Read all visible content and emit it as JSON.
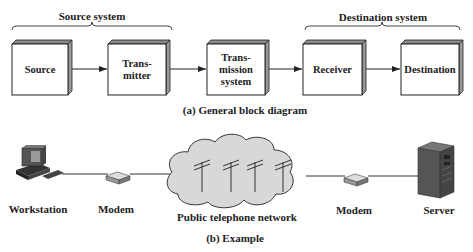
{
  "diagram_a": {
    "caption": "(a) General block diagram",
    "groups": {
      "source_system": "Source system",
      "destination_system": "Destination system"
    },
    "blocks": [
      {
        "id": "source",
        "label": "Source"
      },
      {
        "id": "transmitter",
        "label": "Trans-\nmitter"
      },
      {
        "id": "transmission_system",
        "label": "Trans-\nmission\nsystem"
      },
      {
        "id": "receiver",
        "label": "Receiver"
      },
      {
        "id": "destination",
        "label": "Destination"
      }
    ],
    "arrows": [
      {
        "from": "source",
        "to": "transmitter"
      },
      {
        "from": "transmitter",
        "to": "transmission_system"
      },
      {
        "from": "transmission_system",
        "to": "receiver"
      },
      {
        "from": "receiver",
        "to": "destination"
      }
    ]
  },
  "diagram_b": {
    "caption": "(b) Example",
    "nodes": [
      {
        "id": "workstation",
        "label": "Workstation",
        "icon": "workstation-icon"
      },
      {
        "id": "modem1",
        "label": "Modem",
        "icon": "modem-icon"
      },
      {
        "id": "network",
        "label": "Public telephone network",
        "icon": "cloud-icon"
      },
      {
        "id": "modem2",
        "label": "Modem",
        "icon": "modem-icon"
      },
      {
        "id": "server",
        "label": "Server",
        "icon": "server-icon"
      }
    ]
  }
}
